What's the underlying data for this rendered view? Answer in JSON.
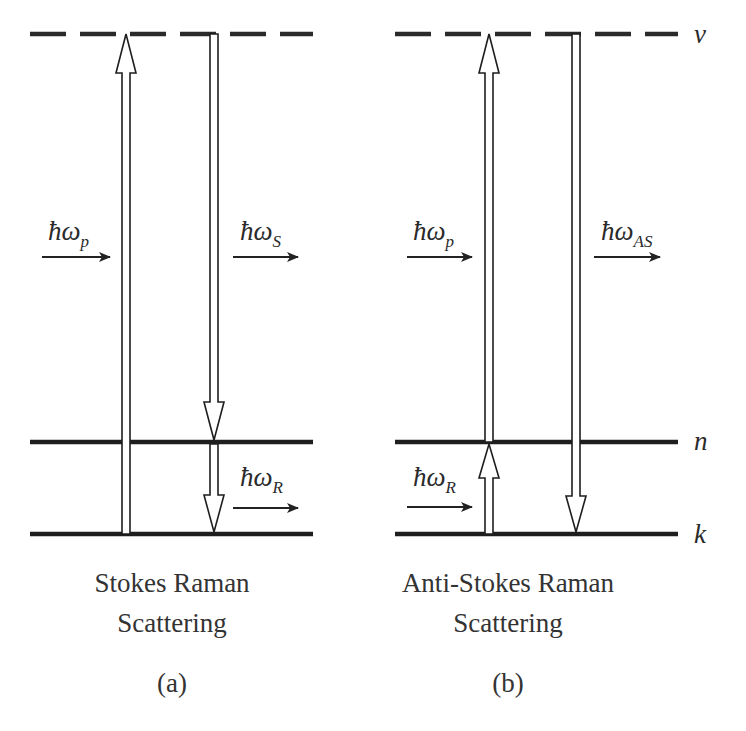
{
  "figure": {
    "panels": [
      {
        "id": "a",
        "caption_line1": "Stokes Raman",
        "caption_line2": "Scattering",
        "panel_label": "(a)",
        "photons": [
          {
            "symbol": "ħω",
            "subscript": "p",
            "direction": "right",
            "role": "pump"
          },
          {
            "symbol": "ħω",
            "subscript": "S",
            "direction": "right",
            "role": "stokes"
          },
          {
            "symbol": "ħω",
            "subscript": "R",
            "direction": "right",
            "role": "raman"
          }
        ],
        "transitions": [
          {
            "from": "k",
            "to": "ν",
            "direction": "up"
          },
          {
            "from": "ν",
            "to": "n",
            "direction": "down"
          },
          {
            "from": "n",
            "to": "k",
            "direction": "down"
          }
        ]
      },
      {
        "id": "b",
        "caption_line1": "Anti-Stokes Raman",
        "caption_line2": "Scattering",
        "panel_label": "(b)",
        "photons": [
          {
            "symbol": "ħω",
            "subscript": "p",
            "direction": "right",
            "role": "pump"
          },
          {
            "symbol": "ħω",
            "subscript": "AS",
            "direction": "right",
            "role": "anti-stokes"
          },
          {
            "symbol": "ħω",
            "subscript": "R",
            "direction": "right",
            "role": "raman"
          }
        ],
        "transitions": [
          {
            "from": "k",
            "to": "n",
            "direction": "up"
          },
          {
            "from": "n",
            "to": "ν",
            "direction": "up"
          },
          {
            "from": "ν",
            "to": "k",
            "direction": "down"
          }
        ]
      }
    ],
    "levels": {
      "virtual": "ν",
      "upper": "n",
      "ground": "k"
    }
  }
}
